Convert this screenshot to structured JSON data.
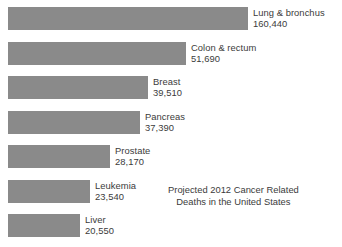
{
  "chart_data": {
    "type": "bar",
    "orientation": "horizontal",
    "title": "",
    "xlabel": "",
    "ylabel": "",
    "grid": false,
    "legend": false,
    "axis_visible": false,
    "bar_color": "#8a8a8a",
    "text_color": "#3b3b3b",
    "background": "#ffffff",
    "xlim": [
      0,
      160440
    ],
    "categories": [
      "Lung & bronchus",
      "Colon & rectum",
      "Breast",
      "Pancreas",
      "Prostate",
      "Leukemia",
      "Liver"
    ],
    "values": [
      160440,
      51690,
      39510,
      37390,
      28170,
      23540,
      20550
    ],
    "value_labels": [
      "160,440",
      "51,690",
      "39,510",
      "37,390",
      "28,170",
      "23,540",
      "20,550"
    ],
    "annotation": {
      "line1": "Projected 2012 Cancer Related",
      "line2": "Deaths in the United States"
    }
  },
  "bars": [
    {
      "label": "Lung & bronchus",
      "value_label": "160,440",
      "px_width": 240,
      "px_top": 7
    },
    {
      "label": "Colon & rectum",
      "value_label": "51,690",
      "px_width": 178,
      "px_top": 42
    },
    {
      "label": "Breast",
      "value_label": "39,510",
      "px_width": 140,
      "px_top": 76
    },
    {
      "label": "Pancreas",
      "value_label": "37,390",
      "px_width": 132,
      "px_top": 111
    },
    {
      "label": "Prostate",
      "value_label": "28,170",
      "px_width": 102,
      "px_top": 145
    },
    {
      "label": "Leukemia",
      "value_label": "23,540",
      "px_width": 82,
      "px_top": 180
    },
    {
      "label": "Liver",
      "value_label": "20,550",
      "px_width": 72,
      "px_top": 214
    }
  ],
  "annotation": {
    "line1": "Projected 2012 Cancer Related",
    "line2": "Deaths in the United States",
    "px_left": 168,
    "px_top": 184
  }
}
